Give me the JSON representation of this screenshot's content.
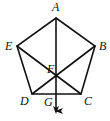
{
  "diagram": {
    "type": "geometry",
    "shape": "regular pentagon",
    "points": {
      "A": {
        "label": "A",
        "x": 56,
        "y": 18,
        "lx": 52,
        "ly": 11
      },
      "B": {
        "label": "B",
        "x": 95,
        "y": 46,
        "lx": 99,
        "ly": 49
      },
      "C": {
        "label": "C",
        "x": 81,
        "y": 94,
        "lx": 83,
        "ly": 104
      },
      "D": {
        "label": "D",
        "x": 32,
        "y": 94,
        "lx": 21,
        "ly": 104
      },
      "E": {
        "label": "E",
        "x": 17,
        "y": 46,
        "lx": 5,
        "ly": 49
      },
      "F": {
        "label": "F",
        "x": 56,
        "y": 77,
        "lx": 47,
        "ly": 72
      },
      "G": {
        "label": "G",
        "x": 56,
        "y": 94,
        "lx": 44,
        "ly": 106
      }
    },
    "segments": [
      "AB",
      "BC",
      "CD",
      "DE",
      "EA",
      "BD",
      "EC"
    ],
    "ray": {
      "from": "A",
      "through": [
        "F",
        "G"
      ],
      "end_x": 56,
      "end_y": 113,
      "arrow": true
    },
    "stroke_color": "#111111"
  }
}
